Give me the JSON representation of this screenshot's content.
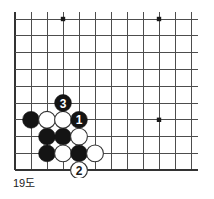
{
  "caption": "19도",
  "colors": {
    "board_background": "#ffffff",
    "grid_line": "#4d4d4d",
    "border_line": "#333333",
    "black_stone": "#141414",
    "white_stone": "#ffffff",
    "white_stone_edge": "#333333",
    "star_point": "#1a1a1a",
    "black_label_text": "#ffffff",
    "white_label_text": "#1a1a1a",
    "caption_text": "#1a1a1a"
  },
  "board": {
    "type": "go-diagram",
    "corner": "top-left",
    "columns": 12,
    "rows": 10,
    "origin_x": 15,
    "origin_y": 19,
    "spacing_x": 16,
    "spacing_y": 16.8,
    "stone_radius": 8.4,
    "star_points": [
      {
        "col": 3,
        "row": 0
      },
      {
        "col": 9,
        "row": 0
      },
      {
        "col": 9,
        "row": 6
      }
    ],
    "stones": [
      {
        "id": "b-a",
        "color": "black",
        "col": 1,
        "row": 6,
        "label": ""
      },
      {
        "id": "w-a",
        "color": "white",
        "col": 2,
        "row": 6,
        "label": ""
      },
      {
        "id": "w-b",
        "color": "white",
        "col": 3,
        "row": 6,
        "label": ""
      },
      {
        "id": "m3",
        "color": "black",
        "col": 3,
        "row": 5,
        "label": "3"
      },
      {
        "id": "m1",
        "color": "black",
        "col": 4,
        "row": 6,
        "label": "1"
      },
      {
        "id": "b-b",
        "color": "black",
        "col": 2,
        "row": 7,
        "label": ""
      },
      {
        "id": "b-c",
        "color": "black",
        "col": 3,
        "row": 7,
        "label": ""
      },
      {
        "id": "w-c",
        "color": "white",
        "col": 4,
        "row": 7,
        "label": ""
      },
      {
        "id": "b-d",
        "color": "black",
        "col": 2,
        "row": 8,
        "label": ""
      },
      {
        "id": "w-d",
        "color": "white",
        "col": 3,
        "row": 8,
        "label": ""
      },
      {
        "id": "b-e",
        "color": "black",
        "col": 4,
        "row": 8,
        "label": ""
      },
      {
        "id": "w-e",
        "color": "white",
        "col": 5,
        "row": 8,
        "label": ""
      },
      {
        "id": "m2",
        "color": "white",
        "col": 4,
        "row": 9,
        "label": "2"
      }
    ]
  }
}
